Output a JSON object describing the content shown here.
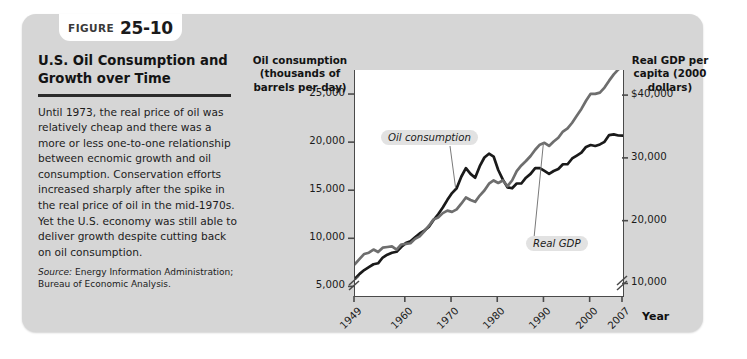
{
  "figure": {
    "badge_word": "FIGURE",
    "badge_number": "25-10",
    "title": "U.S. Oil Consumption and Growth over Time",
    "body": "Until 1973, the real price of oil was relatively cheap and there was a more or less one-to-one relationship between ecnomic growth and oil consumption. Conservation efforts increased sharply after the spike in the real price of oil in the mid-1970s. Yet the U.S. economy was still able to deliver growth despite cutting back on oil consumption.",
    "source_label": "Source:",
    "source_text": "Energy Information Administration; Bureau of Economic Analysis."
  },
  "chart_data": {
    "type": "line",
    "title": "U.S. Oil Consumption and Growth over Time",
    "xlabel": "Year",
    "left_axis_title": "Oil consumption (thousands of barrels per day)",
    "right_axis_title": "Real GDP per capita (2000 dollars)",
    "x": [
      1949,
      1950,
      1951,
      1952,
      1953,
      1954,
      1955,
      1956,
      1957,
      1958,
      1959,
      1960,
      1961,
      1962,
      1963,
      1964,
      1965,
      1966,
      1967,
      1968,
      1969,
      1970,
      1971,
      1972,
      1973,
      1974,
      1975,
      1976,
      1977,
      1978,
      1979,
      1980,
      1981,
      1982,
      1983,
      1984,
      1985,
      1986,
      1987,
      1988,
      1989,
      1990,
      1991,
      1992,
      1993,
      1994,
      1995,
      1996,
      1997,
      1998,
      1999,
      2000,
      2001,
      2002,
      2003,
      2004,
      2005,
      2006,
      2007
    ],
    "left_ticks": [
      "5,000",
      "10,000",
      "15,000",
      "20,000",
      "25,000"
    ],
    "left_tick_values": [
      5000,
      10000,
      15000,
      20000,
      25000
    ],
    "right_ticks": [
      "10,000",
      "20,000",
      "30,000",
      "$40,000"
    ],
    "right_tick_values": [
      10000,
      20000,
      30000,
      40000
    ],
    "x_ticks": [
      "1949",
      "1960",
      "1970",
      "1980",
      "1990",
      "2000",
      "2007"
    ],
    "x_tick_values": [
      1949,
      1960,
      1970,
      1980,
      1990,
      2000,
      2007
    ],
    "ylim_left": [
      4000,
      27500
    ],
    "ylim_right": [
      8000,
      44000
    ],
    "xlim": [
      1949,
      2007
    ],
    "axis_break_left": true,
    "axis_break_right": true,
    "grid": false,
    "legend": "inline-callouts",
    "series": [
      {
        "name": "Oil consumption",
        "axis": "left",
        "color": "#1a1a1a",
        "values": [
          5800,
          6300,
          6700,
          7000,
          7300,
          7400,
          8000,
          8300,
          8500,
          8600,
          9100,
          9500,
          9700,
          10100,
          10500,
          10800,
          11200,
          11900,
          12500,
          13200,
          14000,
          14700,
          15200,
          16400,
          17300,
          16700,
          16300,
          17500,
          18400,
          18800,
          18500,
          17100,
          16100,
          15300,
          15200,
          15700,
          15700,
          16300,
          16700,
          17300,
          17300,
          17000,
          16700,
          17000,
          17200,
          17700,
          17700,
          18300,
          18600,
          18900,
          19500,
          19700,
          19600,
          19760,
          20030,
          20730,
          20800,
          20690,
          20680
        ]
      },
      {
        "name": "Real GDP",
        "axis": "right",
        "color": "#6e6e6e",
        "values": [
          13100,
          13900,
          14700,
          14900,
          15400,
          15000,
          15700,
          15800,
          15900,
          15400,
          16200,
          16300,
          16400,
          17100,
          17500,
          18300,
          19200,
          20200,
          20500,
          21200,
          21600,
          21400,
          21800,
          22700,
          23700,
          23300,
          23000,
          24000,
          24800,
          25900,
          26400,
          26000,
          26400,
          25500,
          26400,
          27900,
          28800,
          29500,
          30300,
          31300,
          32100,
          32400,
          31900,
          32600,
          33200,
          34200,
          34700,
          35600,
          36700,
          37800,
          39100,
          40200,
          40200,
          40400,
          41200,
          42300,
          43300,
          44100,
          44400
        ]
      }
    ],
    "annotations": [
      {
        "text": "Oil consumption",
        "series": "Oil consumption"
      },
      {
        "text": "Real GDP",
        "series": "Real GDP"
      }
    ]
  }
}
